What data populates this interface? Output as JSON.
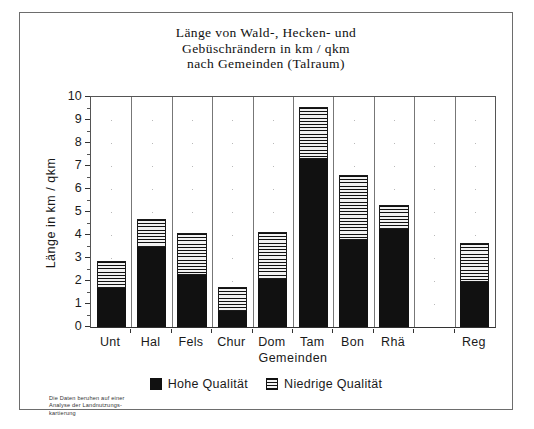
{
  "chart_data": {
    "type": "bar",
    "title": "Länge von Wald-, Hecken- und Gebüschrändern in km / qkm nach Gemeinden (Talraum)",
    "title_lines": [
      "Länge von Wald-, Hecken- und",
      "Gebüschrändern in km / qkm",
      "nach Gemeinden (Talraum)"
    ],
    "xlabel": "Gemeinden",
    "ylabel": "Länge in km / qkm",
    "ylim": [
      0,
      10
    ],
    "ytick_labels": [
      "0",
      "1",
      "2",
      "3",
      "4",
      "5",
      "6",
      "7",
      "8",
      "9",
      "10"
    ],
    "grid": "vertical-separators-with-dots",
    "legend_position": "bottom-center",
    "stacked": true,
    "categories": [
      "Unt",
      "Hal",
      "Fels",
      "Chur",
      "Dom",
      "Tam",
      "Bon",
      "Rhä",
      "",
      "Reg"
    ],
    "series": [
      {
        "name": "Hohe Qualität",
        "color": "#111111",
        "pattern": "solid",
        "values": [
          1.7,
          3.5,
          2.25,
          0.7,
          2.1,
          7.3,
          3.8,
          4.25,
          null,
          1.95
        ]
      },
      {
        "name": "Niedrige Qualität",
        "color": "#f2f2f2",
        "pattern": "horizontal-stripes",
        "values": [
          1.18,
          1.18,
          1.83,
          1.05,
          2.05,
          2.25,
          2.8,
          1.05,
          null,
          1.7
        ]
      }
    ],
    "totals": [
      2.88,
      4.68,
      4.08,
      1.75,
      4.15,
      9.55,
      6.6,
      5.3,
      null,
      3.65
    ],
    "footnote": "Die Daten beruhen auf einer Analyse der Landnutzungs-kartierung",
    "footnote_lines": [
      "Die Daten beruhen auf einer",
      "Analyse der Landnutzungs-",
      "kartierung"
    ]
  },
  "colors": {
    "frame": "#6d6d6d",
    "axis": "#333333",
    "high_quality": "#111111",
    "low_quality_bg": "#f2f2f2",
    "background": "#ffffff"
  }
}
